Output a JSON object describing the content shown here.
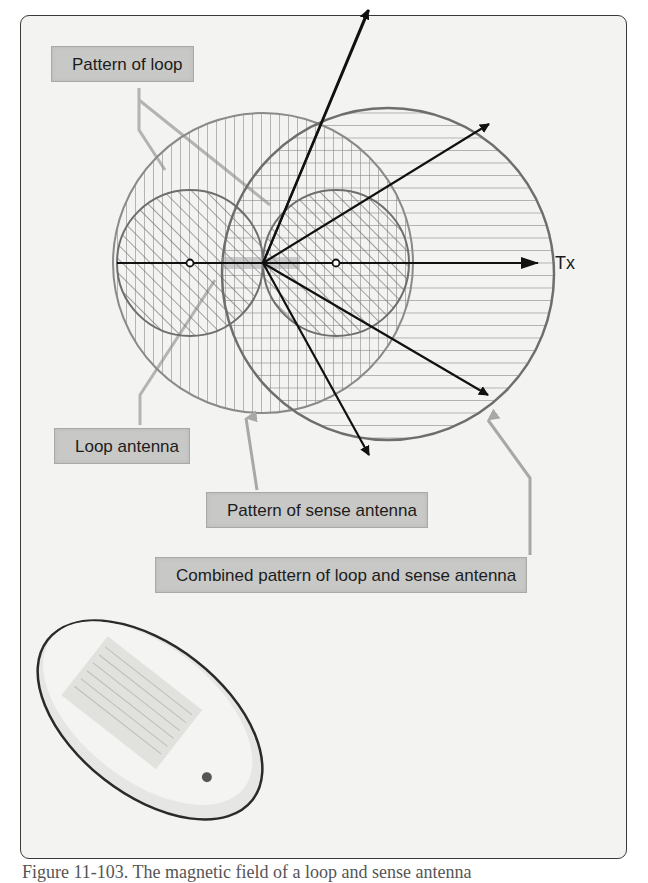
{
  "figure": {
    "labels": {
      "pattern_of_loop": "Pattern of loop",
      "loop_antenna": "Loop antenna",
      "pattern_of_sense_antenna": "Pattern of sense antenna",
      "combined_pattern": "Combined pattern of loop and sense antenna",
      "tx": "Tx"
    },
    "caption": "Figure 11-103. The magnetic field of a loop and sense antenna"
  },
  "colors": {
    "background": "#f3f3f2",
    "frame_border": "#3a3a3a",
    "label_fill": "#c8c8c6",
    "label_border": "#a9a9a7",
    "circle_stroke": "#6e6e6e",
    "hatch": "#7a7a7a",
    "arrow": "#111111",
    "pointer": "#a8a8a8"
  }
}
